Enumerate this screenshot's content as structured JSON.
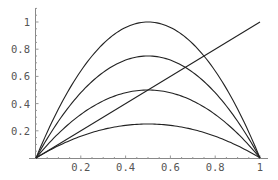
{
  "chart_data": {
    "type": "line",
    "title": "",
    "xlabel": "",
    "ylabel": "",
    "xlim": [
      0,
      1
    ],
    "ylim": [
      0,
      1.1
    ],
    "grid": false,
    "legend": null,
    "x_ticks": [
      "0.2",
      "0.4",
      "0.6",
      "0.8",
      "1"
    ],
    "y_ticks": [
      "0.2",
      "0.4",
      "0.6",
      "0.8",
      "1"
    ],
    "series": [
      {
        "name": "4x(1-x)",
        "formula": "4*x*(1-x)",
        "x": [
          0,
          0.1,
          0.2,
          0.3,
          0.4,
          0.5,
          0.6,
          0.7,
          0.8,
          0.9,
          1
        ],
        "values": [
          0,
          0.36,
          0.64,
          0.84,
          0.96,
          1.0,
          0.96,
          0.84,
          0.64,
          0.36,
          0
        ]
      },
      {
        "name": "3x(1-x)",
        "formula": "3*x*(1-x)",
        "x": [
          0,
          0.1,
          0.2,
          0.3,
          0.4,
          0.5,
          0.6,
          0.7,
          0.8,
          0.9,
          1
        ],
        "values": [
          0,
          0.27,
          0.48,
          0.63,
          0.72,
          0.75,
          0.72,
          0.63,
          0.48,
          0.27,
          0
        ]
      },
      {
        "name": "2x(1-x)",
        "formula": "2*x*(1-x)",
        "x": [
          0,
          0.1,
          0.2,
          0.3,
          0.4,
          0.5,
          0.6,
          0.7,
          0.8,
          0.9,
          1
        ],
        "values": [
          0,
          0.18,
          0.32,
          0.42,
          0.48,
          0.5,
          0.48,
          0.42,
          0.32,
          0.18,
          0
        ]
      },
      {
        "name": "x(1-x)",
        "formula": "x*(1-x)",
        "x": [
          0,
          0.1,
          0.2,
          0.3,
          0.4,
          0.5,
          0.6,
          0.7,
          0.8,
          0.9,
          1
        ],
        "values": [
          0,
          0.09,
          0.16,
          0.21,
          0.24,
          0.25,
          0.24,
          0.21,
          0.16,
          0.09,
          0
        ]
      },
      {
        "name": "x",
        "formula": "x",
        "x": [
          0,
          1
        ],
        "values": [
          0,
          1
        ]
      }
    ]
  },
  "style": {
    "line_color": "#222222",
    "axis_color": "#888888",
    "label_color": "#555555",
    "background": "#ffffff"
  }
}
